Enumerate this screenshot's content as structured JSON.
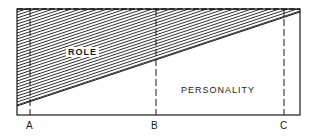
{
  "diagram": {
    "regions": {
      "role": {
        "label": "ROLE",
        "fill": "hatched"
      },
      "personality": {
        "label": "PERSONALITY",
        "fill": "white"
      }
    },
    "markers": [
      {
        "label": "A"
      },
      {
        "label": "B"
      },
      {
        "label": "C"
      }
    ],
    "colors": {
      "ink": "#1a1a1a",
      "background": "#ffffff"
    }
  }
}
